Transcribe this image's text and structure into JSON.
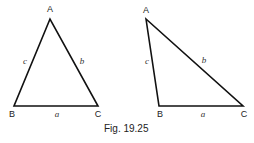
{
  "figure": {
    "caption": "Fig. 19.25",
    "line_color": "#111111",
    "triangles": [
      {
        "name": "acute-triangle",
        "vertices": {
          "A": {
            "label": "A",
            "x": 50,
            "y": 19
          },
          "B": {
            "label": "B",
            "x": 14,
            "y": 106
          },
          "C": {
            "label": "C",
            "x": 98,
            "y": 106
          }
        },
        "sides": {
          "a": "a",
          "b": "b",
          "c": "c"
        }
      },
      {
        "name": "obtuse-triangle",
        "vertices": {
          "A": {
            "label": "A",
            "x": 146,
            "y": 19
          },
          "B": {
            "label": "B",
            "x": 159,
            "y": 106
          },
          "C": {
            "label": "C",
            "x": 243,
            "y": 106
          }
        },
        "sides": {
          "a": "a",
          "b": "b",
          "c": "c"
        }
      }
    ]
  }
}
